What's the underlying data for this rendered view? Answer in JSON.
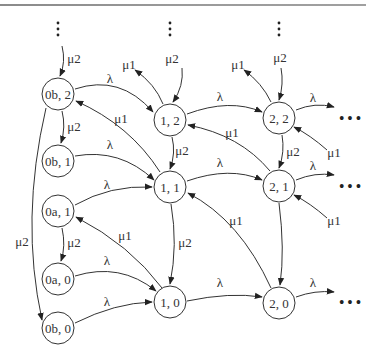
{
  "diagram": {
    "type": "state-transition",
    "nodes": [
      {
        "id": "0b2",
        "label": "0b, 2",
        "x": 58,
        "y": 94
      },
      {
        "id": "0b1",
        "label": "0b, 1",
        "x": 58,
        "y": 161
      },
      {
        "id": "0a1",
        "label": "0a, 1",
        "x": 58,
        "y": 211
      },
      {
        "id": "0a0",
        "label": "0a, 0",
        "x": 58,
        "y": 279
      },
      {
        "id": "0b0",
        "label": "0b, 0",
        "x": 58,
        "y": 328
      },
      {
        "id": "12",
        "label": "1, 2",
        "x": 170,
        "y": 120
      },
      {
        "id": "11",
        "label": "1, 1",
        "x": 170,
        "y": 187
      },
      {
        "id": "10",
        "label": "1, 0",
        "x": 170,
        "y": 302
      },
      {
        "id": "22",
        "label": "2, 2",
        "x": 279,
        "y": 118
      },
      {
        "id": "21",
        "label": "2, 1",
        "x": 279,
        "y": 186
      },
      {
        "id": "20",
        "label": "2, 0",
        "x": 279,
        "y": 303
      }
    ],
    "edge_labels": {
      "lambda": "λ",
      "mu1": "μ1",
      "mu2": "μ2",
      "ellipsis_h": "• • •"
    },
    "edges": [
      {
        "from": "top0",
        "to": "0b2",
        "label": "μ2"
      },
      {
        "from": "0b2",
        "to": "0b1",
        "label": "μ2"
      },
      {
        "from": "0b2",
        "to": "0b0",
        "label": "μ2"
      },
      {
        "from": "0a1",
        "to": "0a0",
        "label": "μ2"
      },
      {
        "from": "0b2",
        "to": "12",
        "label": "λ"
      },
      {
        "from": "0b1",
        "to": "11",
        "label": "λ"
      },
      {
        "from": "0a1",
        "to": "11",
        "label": "λ"
      },
      {
        "from": "0a0",
        "to": "10",
        "label": "λ"
      },
      {
        "from": "0b0",
        "to": "10",
        "label": "λ"
      },
      {
        "from": "11",
        "to": "0b2",
        "label": "μ1"
      },
      {
        "from": "10",
        "to": "0a1",
        "label": "μ1"
      },
      {
        "from": "top1",
        "to": "12",
        "label": "μ2"
      },
      {
        "from": "12",
        "to": "out",
        "label": "μ1"
      },
      {
        "from": "12",
        "to": "11",
        "label": "μ2"
      },
      {
        "from": "11",
        "to": "10",
        "label": "μ2"
      },
      {
        "from": "12",
        "to": "22",
        "label": "λ"
      },
      {
        "from": "11",
        "to": "21",
        "label": "λ"
      },
      {
        "from": "10",
        "to": "20",
        "label": "λ"
      },
      {
        "from": "21",
        "to": "12",
        "label": "μ1"
      },
      {
        "from": "20",
        "to": "11",
        "label": "μ1"
      },
      {
        "from": "top2",
        "to": "22",
        "label": "μ2"
      },
      {
        "from": "22",
        "to": "out",
        "label": "μ1"
      },
      {
        "from": "22",
        "to": "21",
        "label": "μ2"
      },
      {
        "from": "21",
        "to": "20",
        "label": ""
      },
      {
        "from": "22",
        "to": "right",
        "label": "λ"
      },
      {
        "from": "21",
        "to": "right",
        "label": "λ"
      },
      {
        "from": "20",
        "to": "right",
        "label": "λ"
      },
      {
        "from": "right",
        "to": "22",
        "label": "μ1"
      },
      {
        "from": "right",
        "to": "21",
        "label": "μ1"
      }
    ]
  }
}
